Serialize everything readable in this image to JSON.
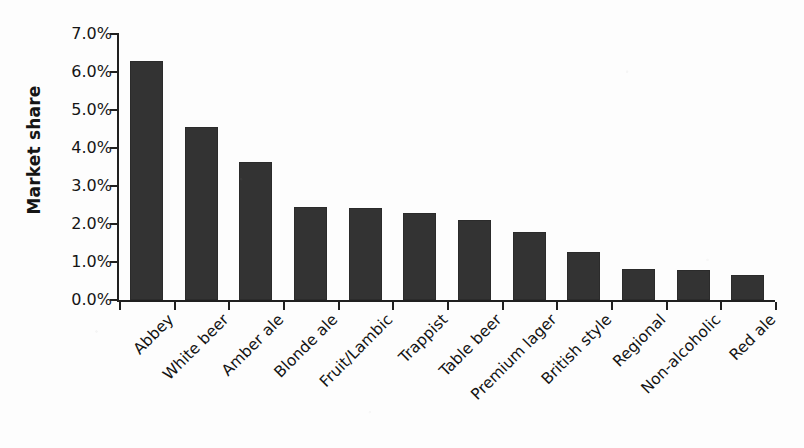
{
  "chart_data": {
    "type": "bar",
    "title": "",
    "xlabel": "",
    "ylabel": "Market share",
    "categories": [
      "Abbey",
      "White beer",
      "Amber ale",
      "Blonde ale",
      "Fruit/Lambic",
      "Trappist",
      "Table beer",
      "Premium lager",
      "British style",
      "Regional",
      "Non-alcoholic",
      "Red ale"
    ],
    "values": [
      6.3,
      4.55,
      3.62,
      2.46,
      2.42,
      2.28,
      2.1,
      1.8,
      1.27,
      0.82,
      0.78,
      0.67
    ],
    "value_unit": "%",
    "ylim": [
      0.0,
      7.0
    ],
    "ytick_values": [
      7.0,
      6.0,
      5.0,
      4.0,
      3.0,
      2.0,
      1.0,
      0.0
    ],
    "ytick_labels": [
      "7.0%",
      "6.0%",
      "5.0%",
      "4.0%",
      "3.0%",
      "2.0%",
      "1.0%",
      "0.0%"
    ],
    "grid": false,
    "legend": false,
    "legend_position": "none",
    "bar_color": "#333333",
    "axis_color": "#202020",
    "background_color": "#fdfdfd",
    "label_rotation_degrees": -45
  }
}
